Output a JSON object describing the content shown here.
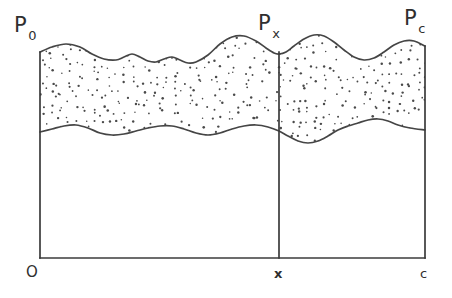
{
  "figure": {
    "background_color": "#ffffff",
    "line_color": "#3b3b3b",
    "curve_color": "#454545",
    "stipple_color": "#4a4a4a"
  },
  "labels": {
    "p0": {
      "base": "P",
      "sub": "0"
    },
    "px": {
      "base": "P",
      "sub": "x"
    },
    "pc": {
      "base": "P",
      "sub": "c"
    },
    "origin": "O",
    "x_tick": "x",
    "c_tick": "c"
  },
  "geometry": {
    "origin_x": 40,
    "baseline_y": 258,
    "right_x": 425,
    "divider_x": 279,
    "left_axis_top_y": 52,
    "right_axis_top_y": 46,
    "divider_top_y": 52
  },
  "chart_data": {
    "type": "area",
    "title": "",
    "xlabel": "",
    "ylabel": "",
    "axis_tick_labels": [
      "O",
      "x",
      "c"
    ],
    "annotations": [
      "P0",
      "Px",
      "Pc"
    ],
    "grid": false,
    "legend": "none",
    "upper_curve": [
      [
        40,
        52
      ],
      [
        52,
        47
      ],
      [
        66,
        44
      ],
      [
        80,
        47
      ],
      [
        92,
        54
      ],
      [
        104,
        59
      ],
      [
        116,
        60
      ],
      [
        124,
        57
      ],
      [
        132,
        54
      ],
      [
        140,
        57
      ],
      [
        148,
        61
      ],
      [
        156,
        62
      ],
      [
        164,
        59
      ],
      [
        172,
        57
      ],
      [
        180,
        60
      ],
      [
        188,
        63
      ],
      [
        196,
        62
      ],
      [
        208,
        55
      ],
      [
        220,
        44
      ],
      [
        232,
        37
      ],
      [
        244,
        36
      ],
      [
        256,
        41
      ],
      [
        266,
        48
      ],
      [
        274,
        53
      ],
      [
        279,
        54
      ],
      [
        286,
        52
      ],
      [
        294,
        46
      ],
      [
        304,
        39
      ],
      [
        314,
        35
      ],
      [
        324,
        36
      ],
      [
        334,
        42
      ],
      [
        344,
        50
      ],
      [
        354,
        57
      ],
      [
        364,
        60
      ],
      [
        374,
        58
      ],
      [
        384,
        52
      ],
      [
        394,
        45
      ],
      [
        404,
        41
      ],
      [
        414,
        41
      ],
      [
        425,
        46
      ]
    ],
    "lower_curve": [
      [
        40,
        132
      ],
      [
        52,
        129
      ],
      [
        64,
        126
      ],
      [
        76,
        125
      ],
      [
        88,
        128
      ],
      [
        100,
        133
      ],
      [
        112,
        135
      ],
      [
        124,
        134
      ],
      [
        136,
        131
      ],
      [
        148,
        128
      ],
      [
        160,
        126
      ],
      [
        172,
        126
      ],
      [
        184,
        129
      ],
      [
        196,
        133
      ],
      [
        208,
        135
      ],
      [
        220,
        133
      ],
      [
        232,
        129
      ],
      [
        244,
        126
      ],
      [
        256,
        125
      ],
      [
        268,
        127
      ],
      [
        279,
        131
      ],
      [
        288,
        136
      ],
      [
        298,
        141
      ],
      [
        308,
        143
      ],
      [
        318,
        141
      ],
      [
        328,
        136
      ],
      [
        338,
        130
      ],
      [
        348,
        126
      ],
      [
        358,
        123
      ],
      [
        368,
        120
      ],
      [
        378,
        119
      ],
      [
        388,
        121
      ],
      [
        398,
        125
      ],
      [
        410,
        128
      ],
      [
        425,
        130
      ]
    ]
  }
}
